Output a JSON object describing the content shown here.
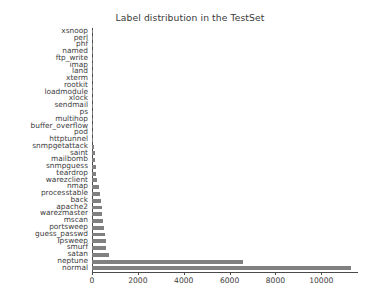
{
  "chart_data": {
    "type": "bar",
    "orientation": "horizontal",
    "title": "Label distribution in the TestSet",
    "xlabel": "",
    "ylabel": "",
    "grid": false,
    "legend": null,
    "xlim": [
      0,
      11600
    ],
    "xticks": [
      0,
      2000,
      4000,
      6000,
      8000,
      10000
    ],
    "xtick_labels": [
      "0",
      "2000",
      "4000",
      "6000",
      "8000",
      "10000"
    ],
    "categories": [
      "xsnoop",
      "perl",
      "phf",
      "named",
      "ftp_write",
      "imap",
      "land",
      "xterm",
      "rootkit",
      "loadmodule",
      "xlock",
      "sendmail",
      "ps",
      "multihop",
      "buffer_overflow",
      "pod",
      "httptunnel",
      "snmpgetattack",
      "saint",
      "mailbomb",
      "snmpguess",
      "teardrop",
      "warezclient",
      "nmap",
      "processtable",
      "back",
      "apache2",
      "warezmaster",
      "mscan",
      "portsweep",
      "guess_passwd",
      "Ipsweep",
      "smurf",
      "satan",
      "neptune",
      "normal"
    ],
    "values": [
      4,
      5,
      6,
      8,
      9,
      11,
      12,
      13,
      15,
      17,
      18,
      20,
      22,
      24,
      30,
      41,
      62,
      75,
      110,
      140,
      170,
      190,
      230,
      310,
      350,
      380,
      420,
      440,
      480,
      530,
      560,
      590,
      620,
      740,
      6600,
      11280
    ],
    "bar_color": "#808080",
    "background_color": "#ffffff",
    "axis_color": "#4a4a4a"
  }
}
